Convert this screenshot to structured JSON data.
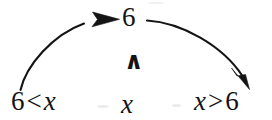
{
  "figure": {
    "kind": "math-notation-diagram",
    "background_color": "#ffffff",
    "ink_color": "#141414"
  },
  "expressions": {
    "top": "6",
    "left": {
      "full": "6 < x",
      "left_operand": "6",
      "relation": "<",
      "right_operand": "x"
    },
    "center": "x",
    "right": {
      "full": "x > 6",
      "left_operand": "x",
      "relation": ">",
      "right_operand": "6"
    },
    "wedge_symbol": "∧"
  },
  "arrows": [
    {
      "name": "left-to-top-arc",
      "from": "6 (left operand of 6 < x)",
      "to": "6 (top)",
      "direction": "up-right",
      "head": "end"
    },
    {
      "name": "top-to-right-arc",
      "from": "6 (top)",
      "to": "6 (right operand of x > 6)",
      "direction": "down-right",
      "head": "end"
    }
  ]
}
